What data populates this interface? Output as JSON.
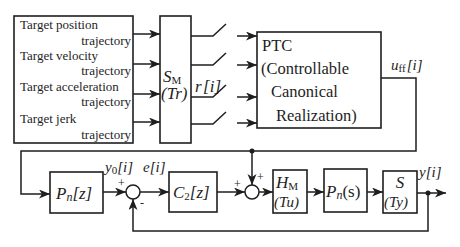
{
  "source_block": {
    "lines": [
      {
        "title": "Target position",
        "suffix": "trajectory"
      },
      {
        "title": "Target velocity",
        "suffix": "trajectory"
      },
      {
        "title": "Target acceleration",
        "suffix": "trajectory"
      },
      {
        "title": "Target jerk",
        "suffix": "trajectory"
      }
    ]
  },
  "sampler": {
    "symbol": "S",
    "subscript": "M",
    "param": "(Tr)"
  },
  "switch_signal": {
    "symbol": "r",
    "index": "[i]"
  },
  "ptc": {
    "lines": [
      "PTC",
      "(Controllable",
      "Canonical",
      "Realization)"
    ]
  },
  "signals": {
    "uff": {
      "symbol": "u",
      "subscript": "ff",
      "index": "[i]"
    },
    "y0": {
      "symbol": "y",
      "subscript": "0",
      "index": "[i]"
    },
    "e": {
      "symbol": "e",
      "index": "[i]"
    },
    "y": {
      "symbol": "y",
      "index": "[i]"
    }
  },
  "blocks": {
    "pn_z": {
      "symbol": "P",
      "subscript": "n",
      "arg": "[z]"
    },
    "c2_z": {
      "symbol": "C",
      "subscript": "2",
      "arg": "[z]"
    },
    "hm": {
      "symbol": "H",
      "subscript": "M",
      "param": "(Tu)"
    },
    "pn_s": {
      "symbol": "P",
      "subscript": "n",
      "arg": "(s)"
    },
    "s": {
      "symbol": "S",
      "param": "(Ty)"
    }
  },
  "sum1": {
    "plus": "+",
    "minus": "-"
  },
  "sum2": {
    "plus_left": "+",
    "plus_top": "+"
  },
  "colors": {
    "line": "#1e1e1e",
    "background": "#ffffff"
  }
}
